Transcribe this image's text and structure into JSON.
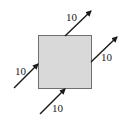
{
  "diagram": {
    "type": "force-diagram",
    "block": {
      "fill": "#d9d9d9",
      "stroke": "#707070"
    },
    "forces": [
      {
        "id": "top",
        "label": "10",
        "from": [
          65,
          36
        ],
        "to": [
          91,
          11
        ],
        "label_pos": [
          66,
          21
        ]
      },
      {
        "id": "right",
        "label": "10",
        "from": [
          91,
          62
        ],
        "to": [
          117,
          37
        ],
        "label_pos": [
          101,
          61
        ]
      },
      {
        "id": "left",
        "label": "10",
        "from": [
          14,
          88
        ],
        "to": [
          38,
          64
        ],
        "label_pos": [
          15,
          75
        ]
      },
      {
        "id": "bottom",
        "label": "10",
        "from": [
          40,
          114
        ],
        "to": [
          65,
          89
        ],
        "label_pos": [
          52,
          112
        ]
      }
    ],
    "arrow_color": "#1a1a1a"
  }
}
